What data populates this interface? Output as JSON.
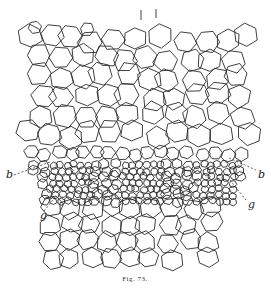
{
  "figure": {
    "caption": "Fig. 73.",
    "labels": [
      {
        "id": "b-left",
        "text": "b"
      },
      {
        "id": "b-right",
        "text": "b"
      },
      {
        "id": "g-left",
        "text": "g"
      },
      {
        "id": "g-right",
        "text": "g"
      }
    ]
  }
}
